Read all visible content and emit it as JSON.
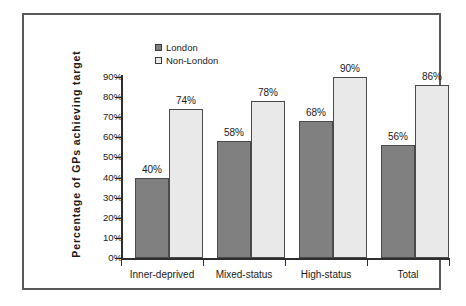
{
  "chart_data": {
    "type": "bar",
    "title": "",
    "xlabel": "",
    "ylabel": "Percentage of GPs achieving target",
    "categories": [
      "Inner-deprived",
      "Mixed-status",
      "High-status",
      "Total"
    ],
    "series": [
      {
        "name": "London",
        "color": "#808080",
        "values": [
          40,
          58,
          68,
          56
        ],
        "labels": [
          "40%",
          "58%",
          "68%",
          "56%"
        ]
      },
      {
        "name": "Non-London",
        "color": "#e9e9e9",
        "values": [
          74,
          78,
          90,
          86
        ],
        "labels": [
          "74%",
          "78%",
          "90%",
          "86%"
        ]
      }
    ],
    "ylim": [
      0,
      90
    ],
    "ytick_values": [
      0,
      10,
      20,
      30,
      40,
      50,
      60,
      70,
      80,
      90
    ],
    "ytick_labels": [
      "0%",
      "10%",
      "20%",
      "30%",
      "40%",
      "50%",
      "60%",
      "70%",
      "80%",
      "90%"
    ],
    "grid": false,
    "legend_position": "top-center",
    "legend_entries": [
      "London",
      "Non-London"
    ]
  },
  "axis": {
    "y_title": "Percentage  of  GPs  achieving  target"
  },
  "legend": {
    "items": [
      {
        "label": "London",
        "swatch": "legend-swatch-london"
      },
      {
        "label": "Non-London",
        "swatch": "legend-swatch-non-london"
      }
    ]
  },
  "colors": {
    "london_bar": "#808080",
    "nonlondon_bar": "#e9e9e9",
    "axis": "#2e2e2e",
    "frame": "#5a5a5a",
    "text": "#1a1a1a"
  }
}
